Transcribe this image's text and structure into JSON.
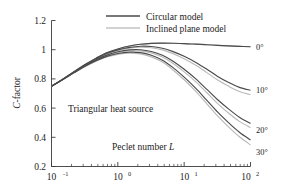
{
  "chart_data": {
    "type": "line",
    "title": "",
    "xlabel": "Peclet number L",
    "ylabel": "C-factor",
    "xscale": "log",
    "xlim": [
      0.1,
      100
    ],
    "ylim": [
      0.2,
      1.2
    ],
    "grid": false,
    "legend_position": "top-center",
    "x_tick_labels": [
      "10-1",
      "100",
      "101",
      "102"
    ],
    "x_tick_values": [
      0.1,
      1,
      10,
      100
    ],
    "y_tick_labels": [
      "0.2",
      "0.4",
      "0.6",
      "0.8",
      "1",
      "1.2"
    ],
    "y_tick_values": [
      0.2,
      0.4,
      0.6,
      0.8,
      1.0,
      1.2
    ],
    "legend": [
      {
        "name": "Circular model",
        "color": "#4a4a4a"
      },
      {
        "name": "Inclined plane model",
        "color": "#b9b9b9"
      }
    ],
    "annotations": [
      {
        "text": "Triangular heat source",
        "x": 0.45,
        "y": 0.625
      },
      {
        "text": "Peclet number L",
        "x": 2.2,
        "y": 0.345
      }
    ],
    "angle_labels": [
      "0°",
      "10°",
      "20°",
      "30°"
    ],
    "x": [
      0.1,
      0.15,
      0.22,
      0.32,
      0.47,
      0.68,
      1.0,
      1.5,
      2.2,
      3.2,
      4.7,
      6.8,
      10,
      15,
      22,
      32,
      47,
      68,
      100
    ],
    "series": [
      {
        "name": "Circular model 0°",
        "model": "circular",
        "angle": "0°",
        "color": "#4a4a4a",
        "values": [
          0.75,
          0.8,
          0.85,
          0.898,
          0.942,
          0.979,
          1.005,
          1.025,
          1.037,
          1.043,
          1.045,
          1.044,
          1.042,
          1.038,
          1.034,
          1.03,
          1.026,
          1.023,
          1.02
        ]
      },
      {
        "name": "Inclined plane model 0°",
        "model": "inclined",
        "angle": "0°",
        "color": "#b9b9b9",
        "values": [
          0.75,
          0.8,
          0.85,
          0.898,
          0.942,
          0.979,
          1.005,
          1.025,
          1.037,
          1.043,
          1.045,
          1.044,
          1.042,
          1.038,
          1.034,
          1.03,
          1.026,
          1.023,
          1.02
        ]
      },
      {
        "name": "Circular model 10°",
        "model": "circular",
        "angle": "10°",
        "color": "#4a4a4a",
        "values": [
          0.75,
          0.799,
          0.848,
          0.895,
          0.938,
          0.974,
          0.999,
          1.016,
          1.024,
          1.022,
          1.01,
          0.987,
          0.955,
          0.913,
          0.866,
          0.817,
          0.775,
          0.742,
          0.722
        ]
      },
      {
        "name": "Inclined plane model 10°",
        "model": "inclined",
        "angle": "10°",
        "color": "#b9b9b9",
        "values": [
          0.75,
          0.798,
          0.847,
          0.893,
          0.935,
          0.97,
          0.995,
          1.011,
          1.017,
          1.013,
          0.999,
          0.973,
          0.938,
          0.893,
          0.843,
          0.792,
          0.749,
          0.714,
          0.692
        ]
      },
      {
        "name": "Circular model 20°",
        "model": "circular",
        "angle": "20°",
        "color": "#4a4a4a",
        "values": [
          0.75,
          0.798,
          0.845,
          0.89,
          0.93,
          0.963,
          0.986,
          0.999,
          1.0,
          0.988,
          0.962,
          0.921,
          0.866,
          0.8,
          0.728,
          0.657,
          0.593,
          0.538,
          0.495
        ]
      },
      {
        "name": "Inclined plane model 20°",
        "model": "inclined",
        "angle": "20°",
        "color": "#b9b9b9",
        "values": [
          0.75,
          0.797,
          0.844,
          0.888,
          0.927,
          0.959,
          0.981,
          0.993,
          0.992,
          0.978,
          0.95,
          0.906,
          0.848,
          0.78,
          0.705,
          0.631,
          0.565,
          0.509,
          0.466
        ]
      },
      {
        "name": "Circular model 30°",
        "model": "circular",
        "angle": "30°",
        "color": "#4a4a4a",
        "values": [
          0.75,
          0.797,
          0.843,
          0.886,
          0.924,
          0.954,
          0.974,
          0.983,
          0.98,
          0.962,
          0.928,
          0.877,
          0.812,
          0.735,
          0.653,
          0.572,
          0.499,
          0.435,
          0.382
        ]
      },
      {
        "name": "Inclined plane model 30°",
        "model": "inclined",
        "angle": "30°",
        "color": "#b9b9b9",
        "values": [
          0.75,
          0.796,
          0.842,
          0.884,
          0.921,
          0.95,
          0.968,
          0.976,
          0.971,
          0.951,
          0.915,
          0.861,
          0.794,
          0.714,
          0.629,
          0.546,
          0.47,
          0.404,
          0.348
        ]
      }
    ]
  },
  "axis": {
    "y_title_main": "C",
    "y_title_rest": "-factor"
  },
  "annotations": {
    "heat_source": "Triangular heat source",
    "peclet_prefix": "Peclet number ",
    "peclet_var": "L"
  },
  "legend": {
    "circular": "Circular model",
    "inclined": "Inclined plane model"
  },
  "angles": {
    "a0": "0°",
    "a10": "10°",
    "a20": "20°",
    "a30": "30°"
  },
  "xticks": {
    "t0_base": "10",
    "t0_exp": "-1",
    "t1_base": "10",
    "t1_exp": "0",
    "t2_base": "10",
    "t2_exp": "1",
    "t3_base": "10",
    "t3_exp": "2"
  },
  "yticks": {
    "y12": "1.2",
    "y10": "1",
    "y08": "0.8",
    "y06": "0.6",
    "y04": "0.4",
    "y02": "0.2"
  }
}
